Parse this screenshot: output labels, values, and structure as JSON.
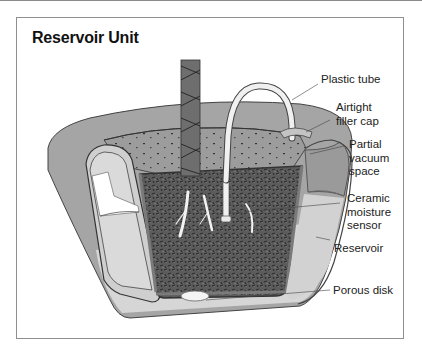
{
  "figure": {
    "title": "Reservoir Unit",
    "labels": [
      {
        "id": "plastic-tube",
        "text": "Plastic tube"
      },
      {
        "id": "airtight-filler-cap",
        "line1": "Airtight",
        "line2": "filler cap"
      },
      {
        "id": "partial-vacuum-space",
        "line1": "Partial",
        "line2": "vacuum",
        "line3": "space"
      },
      {
        "id": "ceramic-moisture-sensor",
        "line1": "Ceramic",
        "line2": "moisture",
        "line3": "sensor"
      },
      {
        "id": "reservoir",
        "text": "Reservoir"
      },
      {
        "id": "porous-disk",
        "text": "Porous disk"
      }
    ],
    "colors": {
      "pot_gray": "#a3a3a3",
      "pot_dark": "#5a5a5a",
      "water_light": "#d4d4d4",
      "soil_dark": "#4a4a4a",
      "vacuum_gray": "#9a9a9a",
      "frame_border": "#8f8f8f"
    }
  }
}
